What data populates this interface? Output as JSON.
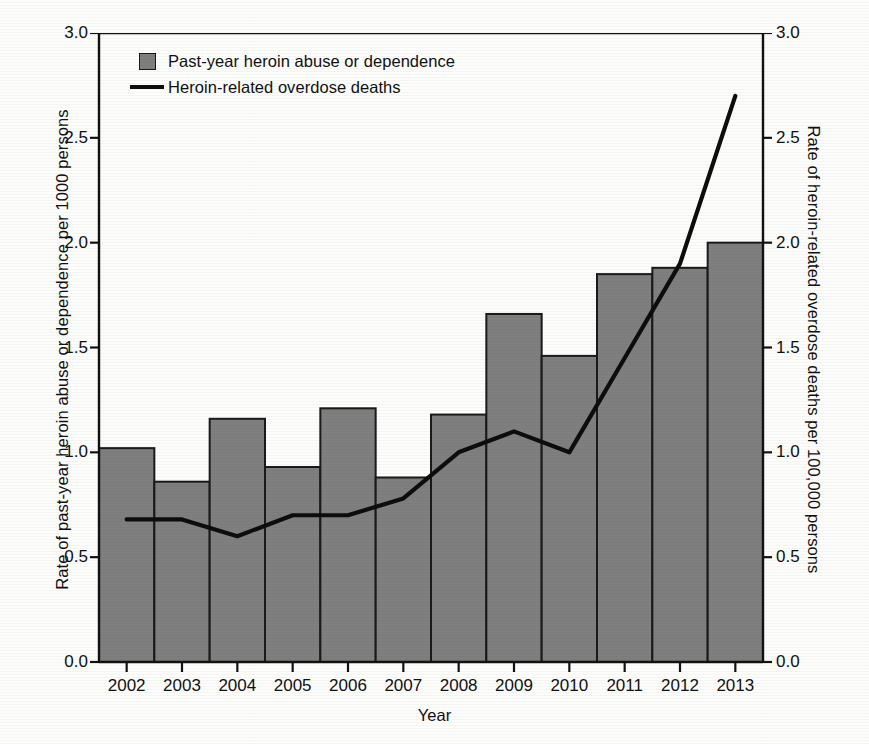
{
  "chart_data": {
    "type": "bar",
    "title": "",
    "xlabel": "Year",
    "ylabel": "Rate of past-year heroin abuse or dependence per 1000 persons",
    "y2label": "Rate of heroin-related overdose deaths per 100,000 persons",
    "categories": [
      "2002",
      "2003",
      "2004",
      "2005",
      "2006",
      "2007",
      "2008",
      "2009",
      "2010",
      "2011",
      "2012",
      "2013"
    ],
    "ylim": [
      0.0,
      3.0
    ],
    "y2lim": [
      0.0,
      3.0
    ],
    "yticks": [
      "0.0",
      "0.5",
      "1.0",
      "1.5",
      "2.0",
      "2.5",
      "3.0"
    ],
    "ytick_values": [
      0.0,
      0.5,
      1.0,
      1.5,
      2.0,
      2.5,
      3.0
    ],
    "y2ticks": [
      "0.0",
      "0.5",
      "1.0",
      "1.5",
      "2.0",
      "2.5",
      "3.0"
    ],
    "grid": false,
    "legend_position": "upper-left-inside",
    "series": [
      {
        "name": "Past-year heroin abuse or dependence",
        "kind": "bar",
        "axis": "left",
        "color": "#7f7f7f",
        "edge_color": "#1a1a1a",
        "values": [
          1.02,
          0.86,
          1.16,
          0.93,
          1.21,
          0.88,
          1.18,
          1.66,
          1.46,
          1.85,
          1.88,
          2.0
        ]
      },
      {
        "name": "Heroin-related overdose deaths",
        "kind": "line",
        "axis": "right",
        "color": "#0d0d0d",
        "values": [
          0.68,
          0.68,
          0.6,
          0.7,
          0.7,
          0.78,
          1.0,
          1.1,
          1.0,
          1.45,
          1.9,
          2.7
        ]
      }
    ]
  },
  "axes": {
    "left_title": "Rate of past-year heroin abuse or dependence per 1000 persons",
    "right_title": "Rate of heroin-related overdose deaths per 100,000 persons",
    "x_title": "Year"
  },
  "legend": {
    "items": [
      {
        "label": "Past-year heroin abuse or dependence",
        "key": "bar-swatch"
      },
      {
        "label": "Heroin-related overdose deaths",
        "key": "line-swatch"
      }
    ]
  },
  "ticks": {
    "y_left": [
      "3.0",
      "2.5",
      "2.0",
      "1.5",
      "1.0",
      "0.5",
      "0.0"
    ],
    "y_right": [
      "3.0",
      "2.5",
      "2.0",
      "1.5",
      "1.0",
      "0.5",
      "0.0"
    ],
    "x": [
      "2002",
      "2003",
      "2004",
      "2005",
      "2006",
      "2007",
      "2008",
      "2009",
      "2010",
      "2011",
      "2012",
      "2013"
    ]
  },
  "colors": {
    "bar_fill": "#7f7f7f",
    "bar_edge": "#1a1a1a",
    "line": "#0d0d0d",
    "axis": "#111111",
    "background": "#fdfdfc"
  }
}
